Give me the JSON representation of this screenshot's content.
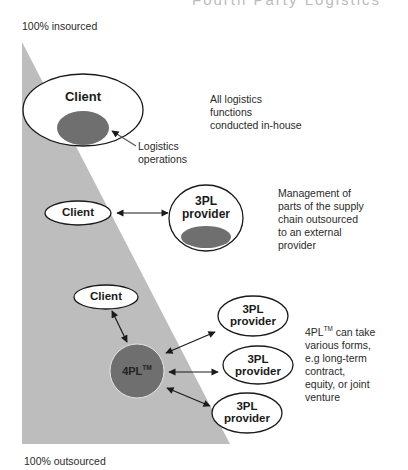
{
  "header": {
    "clipped_title": "Fourth Party Logistics"
  },
  "axis": {
    "top_label": "100% insourced",
    "bottom_label": "100% outsourced"
  },
  "colors": {
    "triangle": "#bdbdbd",
    "operations": "#6f6f6f",
    "node_fill": "#ffffff",
    "outline": "#1a1a1a"
  },
  "stage1": {
    "client_label": "Client",
    "operations_label_line1": "Logistics",
    "operations_label_line2": "operations",
    "description": [
      "All logistics",
      "functions",
      "conducted in-house"
    ]
  },
  "stage2": {
    "client_label": "Client",
    "provider_line1": "3PL",
    "provider_line2": "provider",
    "description": [
      "Management of",
      "parts of the supply",
      "chain outsourced",
      "to an external",
      "provider"
    ]
  },
  "stage3": {
    "client_label": "Client",
    "hub_label": "4PL",
    "hub_tm": "TM",
    "providers": [
      {
        "line1": "3PL",
        "line2": "provider"
      },
      {
        "line1": "3PL",
        "line2": "provider"
      },
      {
        "line1": "3PL",
        "line2": "provider"
      }
    ],
    "description_first": "4PL",
    "description_tm": "TM",
    "description_rest": " can take",
    "description": [
      "various forms,",
      "e.g long-term",
      "contract,",
      "equity, or joint",
      "venture"
    ]
  }
}
